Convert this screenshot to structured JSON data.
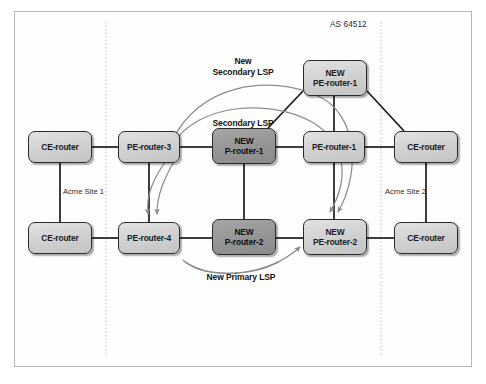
{
  "diagram": {
    "as_label": "AS 64512",
    "site_left_label": "Acme Site 1",
    "site_right_label": "Acme Site 2",
    "labels": {
      "new_secondary_lsp_line1": "New",
      "new_secondary_lsp_line2": "Secondary LSP",
      "secondary_lsp": "Secondary LSP",
      "new_primary_lsp": "New Primary LSP"
    },
    "colors": {
      "node_light": "#d2d2d2",
      "node_dark": "#949494",
      "node_border": "#2b2b2b",
      "link": "#1a1a1a",
      "lsp_arc": "#8c8c8c",
      "boundary_dotted": "#b0b0b0",
      "frame_border": "#b9b9b9",
      "background": "#ffffff"
    },
    "nodes": [
      {
        "id": "ce-left-top",
        "line1": "CE-router",
        "line2": "",
        "shade": "light",
        "x": 28,
        "y": 131,
        "w": 64,
        "h": 32
      },
      {
        "id": "ce-left-bottom",
        "line1": "CE-router",
        "line2": "",
        "shade": "light",
        "x": 28,
        "y": 222,
        "w": 64,
        "h": 32
      },
      {
        "id": "pe-router-3",
        "line1": "PE-router-3",
        "line2": "",
        "shade": "light",
        "x": 118,
        "y": 131,
        "w": 62,
        "h": 32
      },
      {
        "id": "pe-router-4",
        "line1": "PE-router-4",
        "line2": "",
        "shade": "light",
        "x": 118,
        "y": 222,
        "w": 62,
        "h": 32
      },
      {
        "id": "new-p-router-1",
        "line1": "NEW",
        "line2": "P-router-1",
        "shade": "dark",
        "x": 212,
        "y": 128,
        "w": 64,
        "h": 36
      },
      {
        "id": "new-p-router-2",
        "line1": "NEW",
        "line2": "P-router-2",
        "shade": "dark",
        "x": 212,
        "y": 219,
        "w": 64,
        "h": 36
      },
      {
        "id": "pe-router-1",
        "line1": "PE-router-1",
        "line2": "",
        "shade": "light",
        "x": 303,
        "y": 131,
        "w": 62,
        "h": 32
      },
      {
        "id": "new-pe-router-2",
        "line1": "NEW",
        "line2": "PE-router-2",
        "shade": "light",
        "x": 303,
        "y": 219,
        "w": 64,
        "h": 36
      },
      {
        "id": "new-pe-router-1",
        "line1": "NEW",
        "line2": "PE-router-1",
        "shade": "light",
        "x": 303,
        "y": 60,
        "w": 64,
        "h": 36
      },
      {
        "id": "ce-right-top",
        "line1": "CE-router",
        "line2": "",
        "shade": "light",
        "x": 394,
        "y": 131,
        "w": 64,
        "h": 32
      },
      {
        "id": "ce-right-bottom",
        "line1": "CE-router",
        "line2": "",
        "shade": "light",
        "x": 394,
        "y": 222,
        "w": 64,
        "h": 32
      }
    ]
  }
}
